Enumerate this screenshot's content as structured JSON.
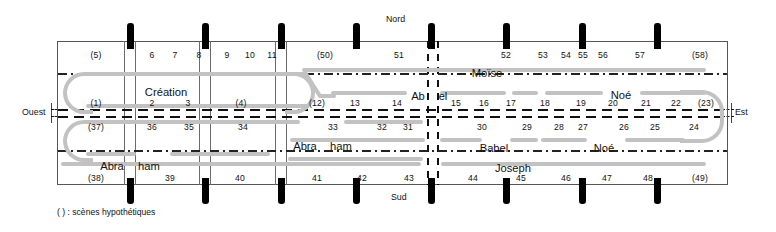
{
  "figure": {
    "title_legend": "( ) : scènes hypothétiques",
    "compass": {
      "north": "Nord",
      "south": "Sud",
      "west": "Ouest",
      "east": "Est"
    },
    "colors": {
      "frame": "#555555",
      "pillar": "#000000",
      "track": "#c2c2c2",
      "text": "#111111"
    }
  },
  "rows": {
    "row1": {
      "name": "north-upper-register",
      "numbers": [
        "(5)",
        "6",
        "7",
        "8",
        "9",
        "10",
        "11",
        "(50)",
        "51",
        "52",
        "53",
        "54",
        "55",
        "56",
        "57",
        "(58)"
      ]
    },
    "row2": {
      "name": "north-lower-register",
      "numbers": [
        "(1)",
        "2",
        "3",
        "(4)",
        "(12)",
        "13",
        "14",
        "15",
        "16",
        "17",
        "18",
        "19",
        "20",
        "21",
        "22",
        "(23)"
      ]
    },
    "row3": {
      "name": "south-upper-register",
      "numbers": [
        "(37)",
        "36",
        "35",
        "34",
        "33",
        "32",
        "31",
        "30",
        "29",
        "28",
        "27",
        "26",
        "25",
        "24"
      ]
    },
    "row4": {
      "name": "south-lower-register",
      "numbers": [
        "(38)",
        "39",
        "40",
        "41",
        "42",
        "43",
        "44",
        "45",
        "46",
        "47",
        "48",
        "(49)"
      ]
    }
  },
  "scene_labels": {
    "creation": "Création",
    "moise": "Moïse",
    "abel_left": "Ab",
    "abel_right": "el",
    "noe_upper": "Noé",
    "abraham_mid": "Abra",
    "abraham_mid2": "ham",
    "babel": "Babel",
    "noe_lower": "Noé",
    "abraham_left": "Abra",
    "abraham_left2": "ham",
    "joseph": "Joseph"
  },
  "numbers_positions": {
    "row1": [
      {
        "label": "(5)",
        "x": 96
      },
      {
        "label": "6",
        "x": 152
      },
      {
        "label": "7",
        "x": 175
      },
      {
        "label": "8",
        "x": 199
      },
      {
        "label": "9",
        "x": 227
      },
      {
        "label": "10",
        "x": 250
      },
      {
        "label": "11",
        "x": 272
      },
      {
        "label": "(50)",
        "x": 325
      },
      {
        "label": "51",
        "x": 399
      },
      {
        "label": "52",
        "x": 506
      },
      {
        "label": "53",
        "x": 543
      },
      {
        "label": "54",
        "x": 566
      },
      {
        "label": "55",
        "x": 583
      },
      {
        "label": "56",
        "x": 603
      },
      {
        "label": "57",
        "x": 640
      },
      {
        "label": "(58)",
        "x": 700
      }
    ],
    "row2": [
      {
        "label": "(1)",
        "x": 96
      },
      {
        "label": "2",
        "x": 152
      },
      {
        "label": "3",
        "x": 188
      },
      {
        "label": "(4)",
        "x": 241
      },
      {
        "label": "(12)",
        "x": 317
      },
      {
        "label": "13",
        "x": 355
      },
      {
        "label": "14",
        "x": 397
      },
      {
        "label": "15",
        "x": 456
      },
      {
        "label": "16",
        "x": 484
      },
      {
        "label": "17",
        "x": 511
      },
      {
        "label": "18",
        "x": 545
      },
      {
        "label": "19",
        "x": 581
      },
      {
        "label": "20",
        "x": 613
      },
      {
        "label": "21",
        "x": 646
      },
      {
        "label": "22",
        "x": 676
      },
      {
        "label": "(23)",
        "x": 706
      }
    ],
    "row3": [
      {
        "label": "(37)",
        "x": 96
      },
      {
        "label": "36",
        "x": 152
      },
      {
        "label": "35",
        "x": 189
      },
      {
        "label": "34",
        "x": 243
      },
      {
        "label": "33",
        "x": 333
      },
      {
        "label": "32",
        "x": 382
      },
      {
        "label": "31",
        "x": 408
      },
      {
        "label": "30",
        "x": 482
      },
      {
        "label": "29",
        "x": 527
      },
      {
        "label": "28",
        "x": 559
      },
      {
        "label": "27",
        "x": 583
      },
      {
        "label": "26",
        "x": 624
      },
      {
        "label": "25",
        "x": 655
      },
      {
        "label": "24",
        "x": 694
      }
    ],
    "row4": [
      {
        "label": "(38)",
        "x": 96
      },
      {
        "label": "39",
        "x": 170
      },
      {
        "label": "40",
        "x": 240
      },
      {
        "label": "41",
        "x": 317
      },
      {
        "label": "42",
        "x": 362
      },
      {
        "label": "43",
        "x": 409
      },
      {
        "label": "44",
        "x": 473
      },
      {
        "label": "45",
        "x": 521
      },
      {
        "label": "46",
        "x": 566
      },
      {
        "label": "47",
        "x": 607
      },
      {
        "label": "48",
        "x": 648
      },
      {
        "label": "(49)",
        "x": 700
      }
    ]
  },
  "scene_positions": [
    {
      "key": "creation",
      "label": "Création",
      "x": 166,
      "y": 86
    },
    {
      "key": "moise",
      "label": "Moïse",
      "x": 487,
      "y": 67
    },
    {
      "key": "abel_left",
      "label": "Ab",
      "x": 418,
      "y": 90
    },
    {
      "key": "abel_right",
      "label": "el",
      "x": 443,
      "y": 90
    },
    {
      "key": "noe_upper",
      "label": "Noé",
      "x": 621,
      "y": 89
    },
    {
      "key": "abraham_mid",
      "label": "Abra",
      "x": 305,
      "y": 140
    },
    {
      "key": "abraham_mid2",
      "label": "ham",
      "x": 341,
      "y": 140
    },
    {
      "key": "babel",
      "label": "Babel",
      "x": 494,
      "y": 142
    },
    {
      "key": "noe_lower",
      "label": "Noé",
      "x": 604,
      "y": 142
    },
    {
      "key": "abraham_left",
      "label": "Abra",
      "x": 112,
      "y": 160
    },
    {
      "key": "abraham_left2",
      "label": "ham",
      "x": 149,
      "y": 160
    },
    {
      "key": "joseph",
      "label": "Joseph",
      "x": 513,
      "y": 162
    }
  ],
  "pillars": [
    {
      "x": 128
    },
    {
      "x": 203
    },
    {
      "x": 279
    },
    {
      "x": 354
    },
    {
      "x": 429
    },
    {
      "x": 504
    },
    {
      "x": 580
    },
    {
      "x": 655
    }
  ],
  "column_separators": [
    124,
    134,
    199,
    209,
    275,
    285,
    350,
    360,
    425,
    437
  ]
}
